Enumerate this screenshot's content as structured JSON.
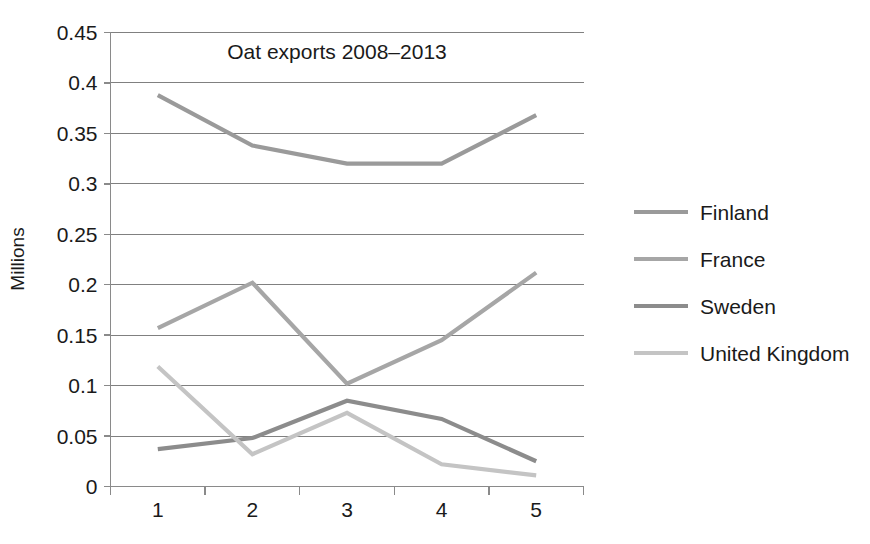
{
  "chart_data": {
    "type": "line",
    "title": "Oat exports 2008–2013",
    "xlabel": "",
    "ylabel": "Millions",
    "x": [
      1,
      2,
      3,
      4,
      5
    ],
    "xticklabels": [
      "1",
      "2",
      "3",
      "4",
      "5"
    ],
    "yticklabels": [
      "0",
      "0.05",
      "0.1",
      "0.15",
      "0.2",
      "0.25",
      "0.3",
      "0.35",
      "0.4",
      "0.45"
    ],
    "ytickvalues": [
      0,
      0.05,
      0.1,
      0.15,
      0.2,
      0.25,
      0.3,
      0.35,
      0.4,
      0.45
    ],
    "ylim": [
      0,
      0.45
    ],
    "xlim": [
      0,
      5.6
    ],
    "grid": "horizontal",
    "legend_position": "right",
    "series": [
      {
        "name": "Finland",
        "color": "#9a9a9a",
        "values": [
          0.388,
          0.338,
          0.32,
          0.32,
          0.368
        ]
      },
      {
        "name": "France",
        "color": "#a6a6a6",
        "values": [
          0.157,
          0.202,
          0.102,
          0.145,
          0.212
        ]
      },
      {
        "name": "Sweden",
        "color": "#8c8c8c",
        "values": [
          0.037,
          0.048,
          0.085,
          0.067,
          0.025
        ]
      },
      {
        "name": "United Kingdom",
        "color": "#c4c4c4",
        "values": [
          0.119,
          0.032,
          0.073,
          0.022,
          0.011
        ]
      }
    ]
  },
  "legend": {
    "items": [
      {
        "label": "Finland"
      },
      {
        "label": "France"
      },
      {
        "label": "Sweden"
      },
      {
        "label": "United Kingdom"
      }
    ]
  }
}
